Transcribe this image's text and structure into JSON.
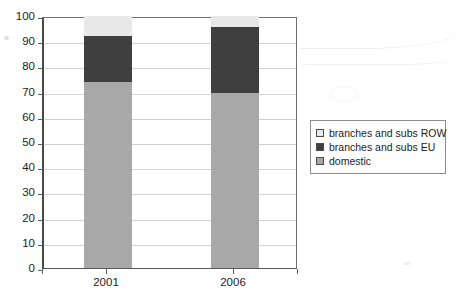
{
  "chart_data": {
    "type": "bar",
    "subtype": "stacked-bar-100",
    "title": "",
    "subtitle": "",
    "xlabel": "",
    "ylabel": "",
    "categories": [
      "2001",
      "2006"
    ],
    "series": [
      {
        "name": "domestic",
        "values": [
          74.0,
          69.5
        ],
        "color": "#a8a8a8"
      },
      {
        "name": "branches and subs EU",
        "values": [
          18.0,
          26.0
        ],
        "color": "#3f3f3f"
      },
      {
        "name": "branches and subs ROW",
        "values": [
          8.0,
          4.5
        ],
        "color": "#e8e8e8"
      }
    ],
    "stack_tops": {
      "2001": {
        "domestic": 74.0,
        "branches and subs EU": 92.0,
        "branches and subs ROW": 100.0
      },
      "2006": {
        "domestic": 69.5,
        "branches and subs EU": 95.5,
        "branches and subs ROW": 100.0
      }
    },
    "ylim": [
      0,
      100
    ],
    "ytick_step": 10,
    "yticks": [
      100,
      90,
      80,
      70,
      60,
      50,
      40,
      30,
      20,
      10,
      0
    ],
    "ytick_labels": [
      "100",
      "90",
      "80",
      "70",
      "60",
      "50",
      "40",
      "30",
      "20",
      "10",
      "0"
    ],
    "grid": "horizontal",
    "legend_position": "right",
    "legend_entries": [
      {
        "label": "branches and subs ROW",
        "color": "#e8e8e8"
      },
      {
        "label": "branches and subs EU",
        "color": "#3f3f3f"
      },
      {
        "label": "domestic",
        "color": "#a8a8a8"
      }
    ],
    "annotations": []
  },
  "axes": {
    "y": {
      "ticks": [
        "100",
        "90",
        "80",
        "70",
        "60",
        "50",
        "40",
        "30",
        "20",
        "10",
        "0"
      ]
    },
    "x": {
      "ticks": [
        "2001",
        "2006"
      ]
    }
  },
  "legend": {
    "items": [
      {
        "label": "branches and subs ROW",
        "swatch": "#e8e8e8"
      },
      {
        "label": "branches and subs EU",
        "swatch": "#3f3f3f"
      },
      {
        "label": "domestic",
        "swatch": "#a8a8a8"
      }
    ]
  },
  "colors": {
    "domestic": "#a8a8a8",
    "branches_subs_eu": "#3f3f3f",
    "branches_subs_row": "#e8e8e8",
    "gridline": "#d2d2d2",
    "axis": "#5a5a5a",
    "legend_border": "#8d8d8d",
    "background": "#ffffff"
  }
}
